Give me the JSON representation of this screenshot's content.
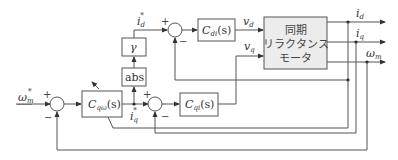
{
  "diagram": {
    "type": "block-diagram",
    "blocks": {
      "motor": {
        "line1": "同期",
        "line2": "リラクタンス",
        "line3": "モータ"
      },
      "c_di": {
        "label": "C",
        "sub": "di",
        "arg": "(s)"
      },
      "c_qi": {
        "label": "C",
        "sub": "qi",
        "arg": "(s)"
      },
      "c_qw": {
        "label": "C",
        "sub": "qω",
        "arg": "(s)"
      },
      "gamma": {
        "label": "γ"
      },
      "abs": {
        "label": "abs"
      }
    },
    "signals": {
      "omega_ref": {
        "base": "ω",
        "sub": "m",
        "sup": "*"
      },
      "id_ref": {
        "base": "i",
        "sub": "d",
        "sup": "*"
      },
      "iq_ref": {
        "base": "i",
        "sub": "q",
        "sup": "*"
      },
      "vd": {
        "base": "v",
        "sub": "d"
      },
      "vq": {
        "base": "v",
        "sub": "q"
      },
      "id": {
        "base": "i",
        "sub": "d"
      },
      "iq": {
        "base": "i",
        "sub": "q"
      },
      "omega_m": {
        "base": "ω",
        "sub": "m"
      }
    },
    "summing_junctions": {
      "speed": {
        "plus": "+",
        "minus": "−"
      },
      "d_current": {
        "plus": "+",
        "minus": "−"
      },
      "q_current": {
        "plus": "+",
        "minus": "−"
      }
    }
  }
}
